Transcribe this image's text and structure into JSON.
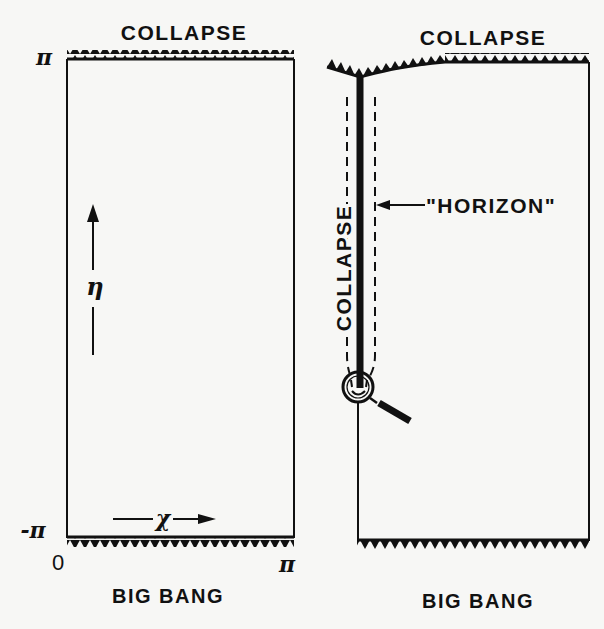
{
  "figure": {
    "type": "conformal spacetime diagrams",
    "background": "#f7f7f5",
    "ink": "#111111"
  },
  "left_diagram": {
    "top_label": "COLLAPSE",
    "bottom_label": "BIG BANG",
    "eta_axis": {
      "symbol": "η",
      "top_tick": "π",
      "bottom_tick": "-π"
    },
    "chi_axis": {
      "symbol": "χ",
      "left_tick": "0",
      "right_tick": "π"
    }
  },
  "right_diagram": {
    "top_label": "COLLAPSE",
    "bottom_label": "BIG BANG",
    "vertical_label": "COLLAPSE",
    "horizon_label": "\"HORIZON\"",
    "icons": {
      "observer": "magnifying-glass-with-smile"
    }
  }
}
